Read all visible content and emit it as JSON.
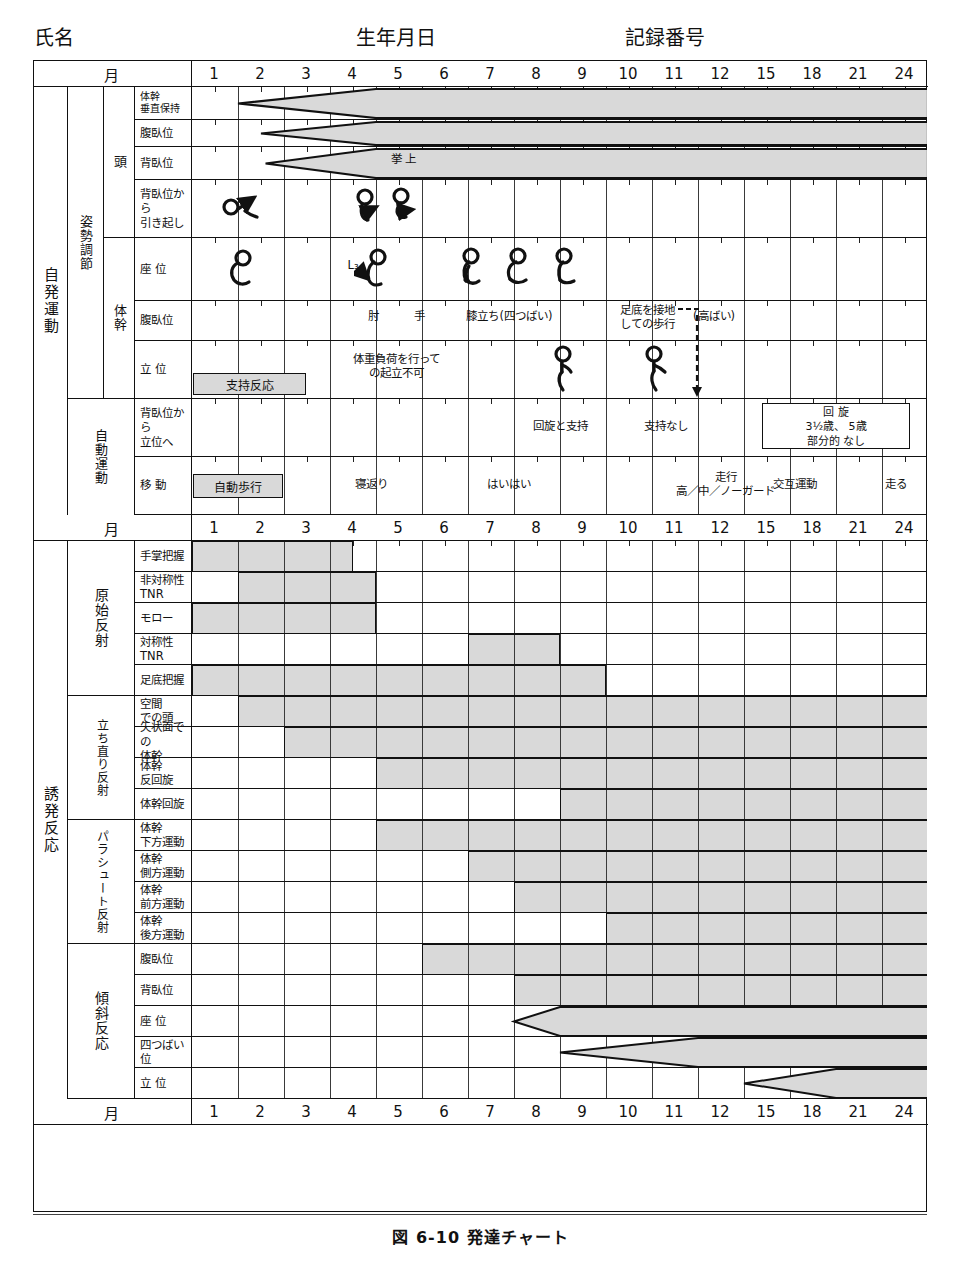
{
  "header": {
    "name_label": "氏名",
    "dob_label": "生年月日",
    "record_label": "記録番号"
  },
  "caption": "図 6-10  発達チャート",
  "axis": {
    "month_word": "月",
    "ticks": [
      "1",
      "2",
      "3",
      "4",
      "5",
      "6",
      "7",
      "8",
      "9",
      "10",
      "11",
      "12",
      "15",
      "18",
      "21",
      "24"
    ]
  },
  "colors": {
    "band": "#d9d9d9",
    "grid": "#3a3a3a",
    "ink": "#111111"
  },
  "upper": {
    "group_label": "自発運動",
    "sub_groups": [
      {
        "label": "姿勢調節"
      },
      {
        "label": "自動運動"
      }
    ],
    "sections": [
      {
        "label": "頭"
      },
      {
        "label": "体幹"
      }
    ],
    "rows": [
      {
        "label": "体幹\n垂直保持",
        "band": {
          "type": "arrow",
          "apex": 1.0,
          "full": 4.0,
          "end": 24
        }
      },
      {
        "label": "腹臥位",
        "band": {
          "type": "arrow",
          "apex": 1.5,
          "full": 4.0,
          "end": 24
        }
      },
      {
        "label": "背臥位",
        "band": {
          "type": "arrow",
          "apex": 1.6,
          "full": 4.0,
          "end": 24
        },
        "notes": [
          {
            "text": "挙 上",
            "x": 4.6
          }
        ]
      },
      {
        "label": "背臥位から\n引き起し",
        "figures": [
          {
            "kind": "pull-to-sit-1",
            "x": 1.0
          },
          {
            "kind": "pull-to-sit-2",
            "x": 3.75
          },
          {
            "kind": "pull-to-sit-3",
            "x": 4.55
          }
        ]
      },
      {
        "label": "座  位",
        "figures": [
          {
            "kind": "sit-c",
            "x": 1.0
          },
          {
            "kind": "sit-L3",
            "x": 3.9
          },
          {
            "kind": "sit-prop",
            "x": 5.95
          },
          {
            "kind": "sit-free",
            "x": 6.95
          },
          {
            "kind": "sit-straight",
            "x": 7.95
          }
        ],
        "notes": [
          {
            "text": "L₃",
            "x": 3.5
          }
        ]
      },
      {
        "label": "腹臥位",
        "notes": [
          {
            "text": "肘",
            "x": 3.95
          },
          {
            "text": "手",
            "x": 4.95
          },
          {
            "text": "膝立ち(四つばい)",
            "x": 6.9
          },
          {
            "text": "足底を接地\nしての歩行",
            "x": 9.9
          },
          {
            "text": "(高ばい)",
            "x": 11.35
          }
        ]
      },
      {
        "label": "立  位",
        "band": {
          "type": "tag",
          "text": "支持反応",
          "start": 0,
          "end": 2.5
        },
        "figures": [
          {
            "kind": "stand-1",
            "x": 7.95
          },
          {
            "kind": "stand-2",
            "x": 9.95
          }
        ],
        "notes": [
          {
            "text": "体重負荷を行って\nの起立不可",
            "x": 4.45
          }
        ]
      }
    ],
    "auto_rows": [
      {
        "label": "背臥位から\n立位へ",
        "notes": [
          {
            "text": "回旋と支持",
            "x": 8.0
          },
          {
            "text": "支持なし",
            "x": 10.3
          }
        ],
        "box": {
          "lines": [
            "回  旋",
            "3½歳、 5歳",
            "部分的  なし"
          ],
          "start": 12.4,
          "end": 15.6
        }
      },
      {
        "label": "移  動",
        "band": {
          "type": "tag",
          "text": "自動歩行",
          "start": 0,
          "end": 2.0
        },
        "notes": [
          {
            "text": "寝返り",
            "x": 3.9
          },
          {
            "text": "はいはい",
            "x": 6.9
          },
          {
            "text": "走行\n高／中／ノーガード",
            "x": 11.6
          },
          {
            "text": "交互運動",
            "x": 13.1
          },
          {
            "text": "走る",
            "x": 15.3
          }
        ]
      }
    ]
  },
  "lower": {
    "group_label": "誘発反応",
    "sections": [
      {
        "label": "原始反射",
        "rows": [
          {
            "label": "手掌把握",
            "bar": {
              "start": 0,
              "end": 3.5
            }
          },
          {
            "label": "非対称性\nTNR",
            "bar": {
              "start": 1,
              "end": 4
            }
          },
          {
            "label": "モロー",
            "bar": {
              "start": 0,
              "end": 4
            }
          },
          {
            "label": "対称性\nTNR",
            "bar": {
              "start": 6,
              "end": 8
            }
          },
          {
            "label": "足底把握",
            "bar": {
              "start": 0,
              "end": 9
            }
          }
        ]
      },
      {
        "label": "立ち直り反射",
        "rows": [
          {
            "label": "空間\nでの頭",
            "bar": {
              "start": 1,
              "end": 16
            }
          },
          {
            "label": "矢状面での\n体幹",
            "bar": {
              "start": 2,
              "end": 16
            }
          },
          {
            "label": "体幹\n反回旋",
            "bar": {
              "start": 4,
              "end": 16
            }
          },
          {
            "label": "体幹回旋",
            "bar": {
              "start": 8,
              "end": 16
            }
          }
        ]
      },
      {
        "label": "パラシュート反射",
        "rows": [
          {
            "label": "体幹\n下方運動",
            "bar": {
              "start": 4,
              "end": 16
            }
          },
          {
            "label": "体幹\n側方運動",
            "bar": {
              "start": 6,
              "end": 16
            }
          },
          {
            "label": "体幹\n前方運動",
            "bar": {
              "start": 7,
              "end": 16
            }
          },
          {
            "label": "体幹\n後方運動",
            "bar": {
              "start": 9,
              "end": 16
            }
          }
        ]
      },
      {
        "label": "傾斜反応",
        "rows": [
          {
            "label": "腹臥位",
            "bar": {
              "start": 5,
              "end": 16
            }
          },
          {
            "label": "背臥位",
            "bar": {
              "start": 7,
              "end": 16
            }
          },
          {
            "label": "座  位",
            "bar": {
              "type": "arrow",
              "apex": 7,
              "full": 8,
              "end": 16
            }
          },
          {
            "label": "四つばい位",
            "bar": {
              "type": "arrow",
              "apex": 8,
              "full": 11,
              "end": 16
            }
          },
          {
            "label": "立  位",
            "bar": {
              "type": "arrow",
              "apex": 12,
              "full": 14,
              "end": 16
            }
          }
        ]
      }
    ]
  }
}
